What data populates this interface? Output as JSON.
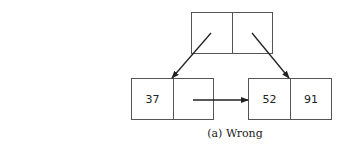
{
  "diagram": {
    "caption": "(a) Wrong",
    "nodes": {
      "root": {
        "cells": [
          "",
          ""
        ]
      },
      "left_leaf": {
        "cells": [
          "37",
          ""
        ]
      },
      "right_leaf": {
        "cells": [
          "52",
          "91"
        ]
      }
    },
    "edges": [
      {
        "from": "root.cell0",
        "to": "left_leaf.divider"
      },
      {
        "from": "root.cell1",
        "to": "right_leaf.divider"
      },
      {
        "from": "left_leaf.cell1",
        "to": "right_leaf"
      }
    ],
    "colors": {
      "stroke": "#555555",
      "arrow": "#222222"
    }
  }
}
